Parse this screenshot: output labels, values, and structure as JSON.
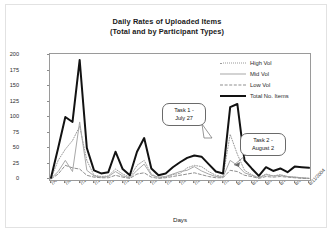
{
  "chart_data": {
    "type": "line",
    "title": "Daily Rates of Uploaded Items",
    "subtitle": "(Total and by Participant Types)",
    "xlabel": "Days",
    "ylabel": "Number of Items per Day",
    "ylim": [
      0,
      200
    ],
    "yticks": [
      0,
      25,
      50,
      75,
      100,
      125,
      150,
      175,
      200
    ],
    "grid": false,
    "legend_position": "top-right",
    "x": [
      "7/6/2004",
      "7/7/2004",
      "7/8/2004",
      "7/9/2004",
      "7/10/2004",
      "7/11/2004",
      "7/12/2004",
      "7/13/2004",
      "7/14/2004",
      "7/15/2004",
      "7/16/2004",
      "7/17/2004",
      "7/18/2004",
      "7/19/2004",
      "7/20/2004",
      "7/21/2004",
      "7/22/2004",
      "7/23/2004",
      "7/24/2004",
      "7/25/2004",
      "7/26/2004",
      "7/27/2004",
      "7/28/2004",
      "7/29/2004",
      "7/30/2004",
      "7/31/2004",
      "8/1/2004",
      "8/2/2004",
      "8/3/2004",
      "8/4/2004",
      "8/5/2004",
      "8/6/2004",
      "8/7/2004",
      "8/8/2004",
      "8/9/2004",
      "8/10/2004",
      "8/11/2004"
    ],
    "xtick_labels": [
      "7/6/2004",
      "7/8/2004",
      "7/10/2004",
      "7/12/2004",
      "7/14/2004",
      "7/16/2004",
      "7/18/2004",
      "7/20/2004",
      "7/22/2004",
      "7/24/2004",
      "7/26/2004",
      "7/28/2004",
      "7/30/2004",
      "8/1/2004",
      "8/3/2004",
      "8/5/2004",
      "8/7/2004",
      "8/9/2004",
      "8/11/2004"
    ],
    "series": [
      {
        "name": "High Vol",
        "style": "dotted",
        "color": "#9a9a9a",
        "width": 1,
        "values": [
          1,
          30,
          48,
          62,
          85,
          30,
          6,
          4,
          5,
          16,
          8,
          3,
          22,
          30,
          8,
          2,
          3,
          7,
          9,
          18,
          22,
          20,
          12,
          6,
          4,
          72,
          40,
          14,
          7,
          2,
          8,
          5,
          7,
          4,
          3,
          2,
          1
        ]
      },
      {
        "name": "Mid Vol",
        "style": "solid",
        "color": "#a8a8a8",
        "width": 1,
        "values": [
          1,
          12,
          30,
          12,
          92,
          14,
          5,
          3,
          4,
          12,
          5,
          2,
          14,
          24,
          6,
          3,
          4,
          8,
          12,
          14,
          20,
          13,
          8,
          4,
          3,
          30,
          22,
          10,
          6,
          2,
          7,
          5,
          6,
          4,
          3,
          2,
          1
        ]
      },
      {
        "name": "Low Vol",
        "style": "dashed",
        "color": "#8f8f8f",
        "width": 1,
        "values": [
          0,
          8,
          22,
          18,
          16,
          6,
          3,
          2,
          2,
          6,
          3,
          1,
          8,
          10,
          3,
          1,
          2,
          4,
          6,
          8,
          10,
          7,
          4,
          2,
          2,
          14,
          12,
          6,
          4,
          1,
          4,
          3,
          4,
          3,
          2,
          1,
          1
        ]
      },
      {
        "name": "Total No. Items",
        "style": "thick-solid",
        "color": "#121212",
        "width": 2,
        "values": [
          2,
          50,
          100,
          92,
          192,
          50,
          14,
          9,
          11,
          44,
          16,
          6,
          44,
          66,
          17,
          6,
          9,
          19,
          27,
          34,
          38,
          36,
          24,
          12,
          9,
          116,
          121,
          30,
          17,
          5,
          19,
          13,
          17,
          11,
          20,
          19,
          18
        ]
      }
    ],
    "annotations": [
      {
        "id": "task1",
        "line1": "Task 1 -",
        "line2": "July 27",
        "points_to": "7/27/2004"
      },
      {
        "id": "task2",
        "line1": "Task 2 -",
        "line2": "August 2",
        "points_to": "8/2/2004"
      }
    ]
  }
}
